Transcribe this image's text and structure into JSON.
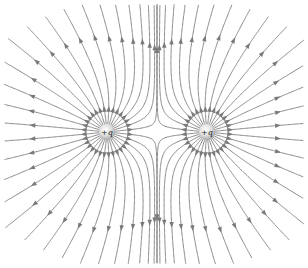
{
  "diagram": {
    "width": 308,
    "height": 268,
    "line_color": "#8a8a8a",
    "arrow_color": "#7a7a7a",
    "charges": [
      {
        "label": "+q",
        "x": 107,
        "y": 132,
        "sign": 1
      },
      {
        "label": "+q",
        "x": 207,
        "y": 132,
        "sign": 1
      }
    ],
    "lines_per_charge": 32,
    "charge_radius": 8,
    "charge_color_center": "#ffffff",
    "charge_color_edge": "#b5b5b5"
  }
}
